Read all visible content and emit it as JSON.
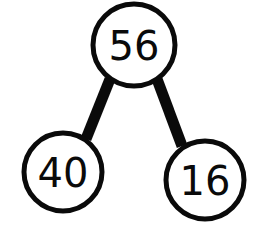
{
  "diagram": {
    "kind": "binary-tree",
    "background_color": "#ffffff",
    "stroke_color": "#0a0a0a",
    "label_color": "#0a0a0a",
    "node_stroke_width": 5,
    "edge_stroke_width": 11,
    "nodes": [
      {
        "id": "root",
        "label": "56",
        "role": "root",
        "cx": 134,
        "cy": 45,
        "r": 41
      },
      {
        "id": "left-child",
        "label": "40",
        "role": "left-child",
        "cx": 63,
        "cy": 172,
        "r": 39
      },
      {
        "id": "right-child",
        "label": "16",
        "role": "right-child",
        "cx": 205,
        "cy": 180,
        "r": 39
      }
    ],
    "edges": [
      {
        "id": "edge-root-left",
        "from": "root",
        "to": "left-child",
        "x1": 110,
        "y1": 79,
        "x2": 86,
        "y2": 139
      },
      {
        "id": "edge-root-right",
        "from": "root",
        "to": "right-child",
        "x1": 157,
        "y1": 79,
        "x2": 182,
        "y2": 146
      }
    ]
  },
  "chart_data": {
    "type": "diagram",
    "subtype": "binary-tree",
    "title": "",
    "values": [
      56,
      40,
      16
    ],
    "labels": [
      "56",
      "40",
      "16"
    ],
    "structure": {
      "root": "56",
      "children": [
        "40",
        "16"
      ]
    }
  }
}
